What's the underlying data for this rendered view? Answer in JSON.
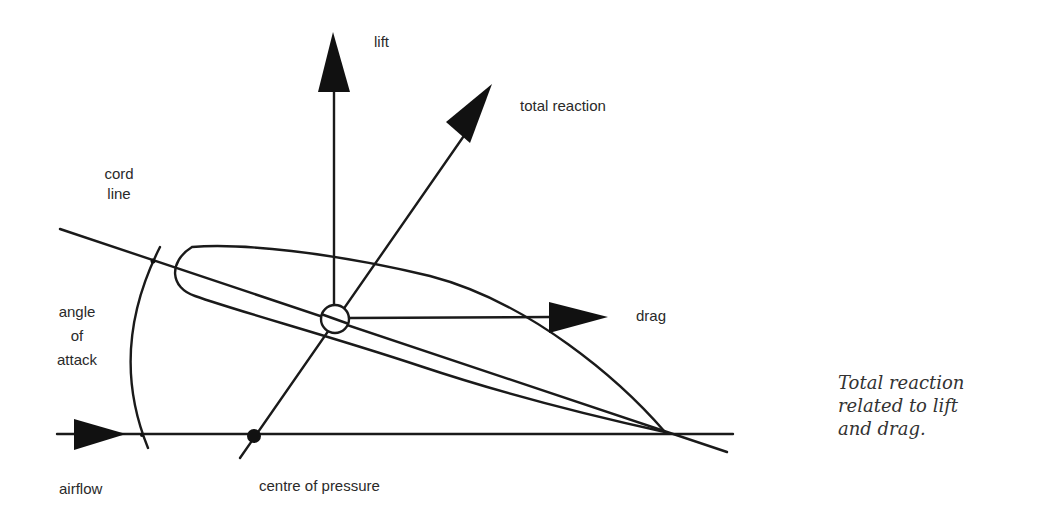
{
  "diagram": {
    "title": "Total reaction related to lift and drag",
    "stroke_color": "#1a1a1a",
    "labels": {
      "lift": "lift",
      "total_reaction": "total reaction",
      "cord_line_1": "cord",
      "cord_line_2": "line",
      "angle_of_attack_1": "angle",
      "angle_of_attack_2": "of",
      "angle_of_attack_3": "attack",
      "drag": "drag",
      "airflow": "airflow",
      "centre_of_pressure": "centre of pressure"
    }
  },
  "caption": {
    "line1": "Total reaction",
    "line2": "related to lift",
    "line3": "and drag."
  }
}
